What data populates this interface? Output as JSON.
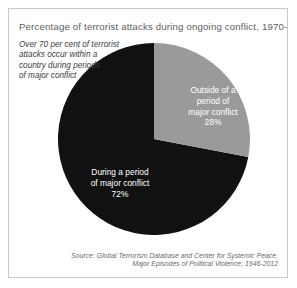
{
  "figure": {
    "title": "Percentage of terrorist attacks during ongoing conflict, 1970-2012",
    "annotation": {
      "line1": "Over 70 per cent of terrorist",
      "line2": "attacks occur within a",
      "line3": "country during periods",
      "line4": "of major conflict"
    },
    "source": {
      "line1": "Source: Global Terrorism Database and Center for Systemic Peace,",
      "line2": "Major Episodes of Political Violence, 1946-2012"
    },
    "labels": {
      "outside": {
        "line1": "Outside of a",
        "line2": "period of",
        "line3": "major conflict",
        "value": "28%"
      },
      "during": {
        "line1": "During a period",
        "line2": "of major conflict",
        "value": "72%"
      }
    }
  },
  "chart_data": {
    "type": "pie",
    "title": "Percentage of terrorist attacks during ongoing conflict, 1970-2012",
    "categories": [
      "During a period of major conflict",
      "Outside of a period of major conflict"
    ],
    "values": [
      72,
      28
    ],
    "unit": "percent",
    "colors": [
      "#111111",
      "#9a9a9a"
    ],
    "label_colors": [
      "#ffffff",
      "#ffffff"
    ],
    "start_angle_deg": 0,
    "direction": "clockwise",
    "slice_order": [
      "Outside of a period of major conflict",
      "During a period of major conflict"
    ],
    "legend": "none",
    "grid": false,
    "annotation": "Over 70 per cent of terrorist attacks occur within a country during periods of major conflict",
    "source": "Source: Global Terrorism Database and Center for Systemic Peace, Major Episodes of Political Violence, 1946-2012"
  }
}
